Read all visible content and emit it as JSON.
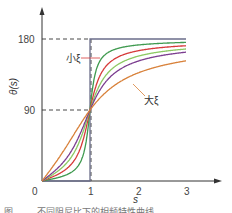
{
  "chart_data": {
    "type": "line",
    "title": "",
    "xlabel": "s",
    "ylabel": "θ(s)",
    "xlim": [
      0,
      3.5
    ],
    "ylim": [
      0,
      190
    ],
    "x_ticks": [
      "0",
      "1",
      "2",
      "3"
    ],
    "y_ticks": [
      "90",
      "180"
    ],
    "grid": false,
    "reference_lines": [
      {
        "type": "horizontal-dashed",
        "y": 180,
        "x_range": [
          0,
          1
        ]
      },
      {
        "type": "horizontal-dashed",
        "y": 90,
        "x_range": [
          0,
          1
        ]
      },
      {
        "type": "vertical-dashed",
        "x": 1,
        "y_range": [
          0,
          180
        ]
      }
    ],
    "annotations": [
      {
        "text": "小ξ",
        "points_to": "steepest curve (green)",
        "at_s": 1.15
      },
      {
        "text": "大ξ",
        "points_to": "shallowest curve (orange)",
        "at_s": 1.9
      }
    ],
    "series": [
      {
        "name": "ξ→0 (step)",
        "color": "#6b6e8a",
        "description": "0 for s<1, 180 for s>1",
        "points": [
          [
            0,
            0
          ],
          [
            1,
            0
          ],
          [
            1,
            180
          ],
          [
            3,
            180
          ]
        ]
      },
      {
        "name": "小ξ",
        "xi": 0.1,
        "color": "#3f9a4f",
        "points": [
          [
            0,
            0
          ],
          [
            0.5,
            7.6
          ],
          [
            0.8,
            24
          ],
          [
            1,
            90
          ],
          [
            1.2,
            156
          ],
          [
            1.5,
            166
          ],
          [
            2,
            172
          ],
          [
            3,
            176
          ]
        ]
      },
      {
        "name": "ξ2",
        "xi": 0.2,
        "color": "#d63a3a",
        "points": [
          [
            0,
            0
          ],
          [
            0.5,
            15
          ],
          [
            0.8,
            42
          ],
          [
            1,
            90
          ],
          [
            1.2,
            132
          ],
          [
            1.5,
            154
          ],
          [
            2,
            165
          ],
          [
            3,
            171
          ]
        ]
      },
      {
        "name": "ξ3",
        "xi": 0.3,
        "color": "#8cc963",
        "points": [
          [
            0,
            0
          ],
          [
            0.5,
            22
          ],
          [
            0.8,
            56
          ],
          [
            1,
            90
          ],
          [
            1.2,
            121
          ],
          [
            1.5,
            144
          ],
          [
            2,
            158
          ],
          [
            3,
            167
          ]
        ]
      },
      {
        "name": "ξ4",
        "xi": 0.4,
        "color": "#7b3d8f",
        "points": [
          [
            0,
            0
          ],
          [
            0.5,
            28
          ],
          [
            0.8,
            61
          ],
          [
            1,
            90
          ],
          [
            1.2,
            115
          ],
          [
            1.5,
            136
          ],
          [
            2,
            152
          ],
          [
            3,
            163
          ]
        ]
      },
      {
        "name": "大ξ",
        "xi": 0.7,
        "color": "#d8813a",
        "points": [
          [
            0,
            0
          ],
          [
            0.5,
            43
          ],
          [
            0.8,
            72
          ],
          [
            1,
            90
          ],
          [
            1.2,
            106
          ],
          [
            1.5,
            120
          ],
          [
            2,
            137
          ],
          [
            3,
            152
          ]
        ]
      }
    ]
  },
  "labels": {
    "y_axis": "θ(s)",
    "x_axis": "s",
    "origin": "0",
    "x1": "1",
    "x2": "2",
    "x3": "3",
    "y90": "90",
    "y180": "180",
    "small_xi": "小ξ",
    "large_xi": "大ξ",
    "caption": "图 …… 不同阻尼比下的相频特性曲线"
  }
}
